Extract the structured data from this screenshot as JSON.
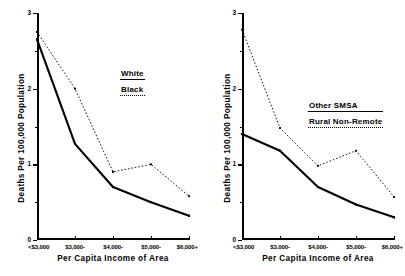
{
  "chart_data": [
    {
      "type": "line",
      "panel": "left",
      "title": "",
      "xlabel": "Per Capita Income of Area",
      "ylabel": "Deaths Per 100,000 Population",
      "categories": [
        "<$3,000",
        "$3,000-",
        "$4,000-",
        "$5,000-",
        "$6,000+"
      ],
      "ylim": [
        0,
        3
      ],
      "yticks": [
        0,
        1,
        2,
        3
      ],
      "ytick_labels": [
        "0",
        "1",
        "2",
        "3"
      ],
      "yminor_ticks": [
        0.5,
        1.5,
        2.5
      ],
      "grid": false,
      "legend_position": "center-right",
      "series": [
        {
          "name": "White",
          "style": "solid",
          "values": [
            2.65,
            1.27,
            0.7,
            0.5,
            0.32
          ]
        },
        {
          "name": "Black",
          "style": "dotted",
          "values": [
            2.75,
            2.0,
            0.9,
            1.0,
            0.58
          ]
        }
      ]
    },
    {
      "type": "line",
      "panel": "right",
      "title": "",
      "xlabel": "Per Capita Income of Area",
      "ylabel": "Deaths Per 100,000 Population",
      "categories": [
        "<$3,000",
        "$3,000-",
        "$4,000-",
        "$5,000-",
        "$6,000+"
      ],
      "ylim": [
        0,
        3
      ],
      "yticks": [
        0,
        1,
        2,
        3
      ],
      "ytick_labels": [
        "0",
        "1",
        "2",
        "3"
      ],
      "yminor_ticks": [
        0.5,
        1.5,
        2.5
      ],
      "grid": false,
      "legend_position": "center-right",
      "series": [
        {
          "name": "Other SMSA",
          "style": "solid",
          "values": [
            1.4,
            1.18,
            0.7,
            0.47,
            0.3
          ]
        },
        {
          "name": "Rural Non-Remote",
          "style": "dotted",
          "values": [
            2.78,
            1.48,
            0.98,
            1.18,
            0.57
          ]
        }
      ]
    }
  ],
  "left": {
    "ylabel": "Deaths Per 100,000 Population",
    "xlabel": "Per Capita Income of Area",
    "legend": {
      "solid_label": "White",
      "dotted_label": "Black"
    },
    "ytick_labels": [
      "0",
      "1",
      "2",
      "3"
    ],
    "xtick_labels": [
      "<$3,000",
      "$3,000-",
      "$4,000-",
      "$5,000-",
      "$6,000+"
    ]
  },
  "right": {
    "ylabel": "Deaths Per 100,000 Population",
    "xlabel": "Per Capita Income of Area",
    "legend": {
      "solid_label": "Other SMSA",
      "dotted_label": "Rural Non-Remote"
    },
    "ytick_labels": [
      "0",
      "1",
      "2",
      "3"
    ],
    "xtick_labels": [
      "<$3,000",
      "$3,000-",
      "$4,000-",
      "$5,000-",
      "$6,000+"
    ]
  },
  "colors": {
    "ink": "#000000",
    "background": "#ffffff"
  }
}
